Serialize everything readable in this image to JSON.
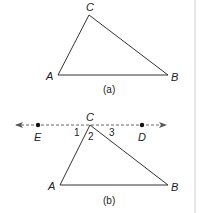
{
  "figure_a": {
    "caption": "(a)",
    "vertices": {
      "A": {
        "label": "A",
        "x": 58,
        "y": 75
      },
      "B": {
        "label": "B",
        "x": 168,
        "y": 75
      },
      "C": {
        "label": "C",
        "x": 89,
        "y": 15
      }
    }
  },
  "figure_b": {
    "caption": "(b)",
    "line": {
      "y": 125,
      "x1": 14,
      "x2": 168,
      "style": "dashed",
      "arrows": "both"
    },
    "points": {
      "E": {
        "label": "E",
        "x": 38,
        "y": 125
      },
      "D": {
        "label": "D",
        "x": 142,
        "y": 125
      }
    },
    "vertices": {
      "A": {
        "label": "A",
        "x": 60,
        "y": 185
      },
      "B": {
        "label": "B",
        "x": 168,
        "y": 185
      },
      "C": {
        "label": "C",
        "x": 90,
        "y": 125
      }
    },
    "angles": [
      {
        "label": "1"
      },
      {
        "label": "2"
      },
      {
        "label": "3"
      }
    ]
  },
  "colors": {
    "stroke": "#333333",
    "divider": "#cccccc"
  }
}
